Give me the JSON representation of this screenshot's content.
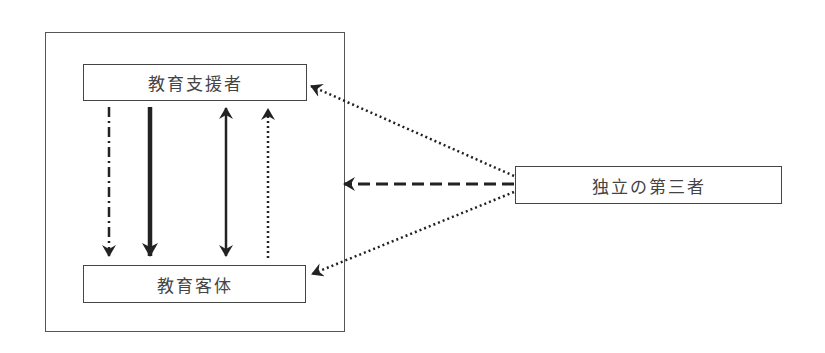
{
  "diagram": {
    "type": "relationship-diagram",
    "nodes": {
      "education_supporter": {
        "label": "教育支援者"
      },
      "education_object": {
        "label": "教育客体"
      },
      "independent_third_party": {
        "label": "独立の第三者"
      }
    },
    "edges": [
      {
        "from": "education_supporter",
        "to": "education_object",
        "style": "dash-dot",
        "direction": "down"
      },
      {
        "from": "education_supporter",
        "to": "education_object",
        "style": "solid-thick",
        "direction": "down"
      },
      {
        "from": "education_supporter",
        "to": "education_object",
        "style": "solid",
        "direction": "both"
      },
      {
        "from": "education_object",
        "to": "education_supporter",
        "style": "dotted",
        "direction": "up"
      },
      {
        "from": "independent_third_party",
        "to": "education_supporter",
        "style": "dotted"
      },
      {
        "from": "independent_third_party",
        "to": "outer_frame",
        "style": "dashed"
      },
      {
        "from": "independent_third_party",
        "to": "education_object",
        "style": "dotted"
      }
    ],
    "colors": {
      "stroke": "#222222",
      "box_border": "#444444",
      "text": "#444444",
      "background": "#ffffff"
    }
  }
}
